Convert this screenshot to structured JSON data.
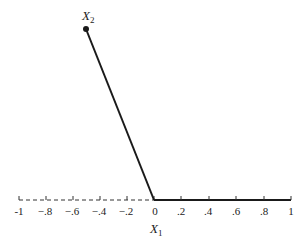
{
  "diagram": {
    "x_axis": {
      "label": "X",
      "label_subscript": "1",
      "ticks": [
        "-1",
        "−.8",
        "−.6",
        "−.4",
        "−.2",
        "0",
        ".2",
        ".4",
        ".6",
        ".8",
        "1"
      ],
      "tick_values": [
        -1,
        -0.8,
        -0.6,
        -0.4,
        -0.2,
        0,
        0.2,
        0.4,
        0.6,
        0.8,
        1
      ],
      "negative_segment_style": "dashed",
      "positive_segment_style": "solid"
    },
    "point": {
      "label": "X",
      "label_subscript": "2"
    },
    "lines": [
      {
        "from": "origin",
        "to": "X2-point",
        "style": "solid"
      }
    ],
    "colors": {
      "ink": "#1a1a1a",
      "background": "#ffffff"
    }
  }
}
